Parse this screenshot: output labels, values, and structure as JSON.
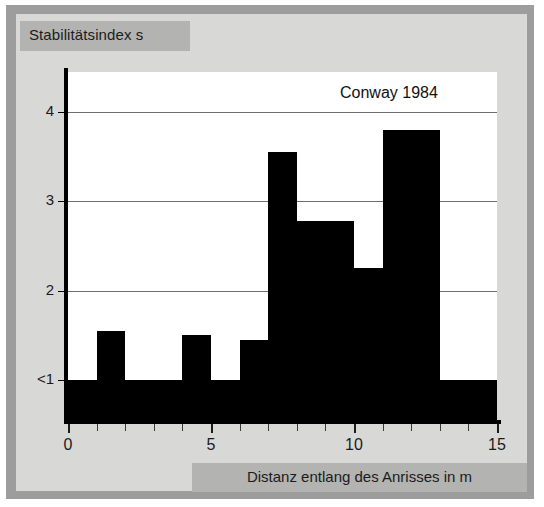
{
  "figure": {
    "annotation": "Conway 1984",
    "y_axis_caption": "Stabilitätsindex s",
    "x_axis_caption": "Distanz entlang des Anrisses in m"
  },
  "colors": {
    "bar": "#000000",
    "panel_background": "#ffffff",
    "plate_background": "#d8d8d6",
    "caption_band": "#b3b3b1",
    "scan_border": "#9d9d9d",
    "gridline": "#6e6e6e",
    "axis": "#000000",
    "text": "#1b1b1b"
  },
  "chart_data": {
    "type": "bar",
    "title": "",
    "subtitle": "",
    "annotations": [
      "Conway 1984"
    ],
    "xlabel": "Distanz entlang des Anrisses in m",
    "ylabel": "Stabilitätsindex s",
    "xlim": [
      0,
      15
    ],
    "ylim": [
      0.55,
      4.45
    ],
    "xticks": [
      0,
      5,
      10,
      15
    ],
    "xtick_labels": [
      "0",
      "5",
      "10",
      "15"
    ],
    "xminor_ticks": [
      1,
      2,
      3,
      4,
      6,
      7,
      8,
      9,
      11,
      12,
      13,
      14
    ],
    "yticks": [
      1,
      2,
      3,
      4
    ],
    "ytick_labels": [
      "<1",
      "2",
      "3",
      "4"
    ],
    "grid": "horizontal",
    "legend": "none",
    "baseline": 1,
    "baseline_note": "bars at the axis minimum represent s < 1",
    "bin_edges": [
      0,
      1,
      2,
      3,
      4,
      5,
      6,
      7,
      8,
      9,
      10,
      11,
      13,
      15
    ],
    "bins": [
      {
        "x0": 0,
        "x1": 1,
        "value": 1.0,
        "label": "<1"
      },
      {
        "x0": 1,
        "x1": 2,
        "value": 1.55,
        "label": "1.55"
      },
      {
        "x0": 2,
        "x1": 3,
        "value": 1.0,
        "label": "<1"
      },
      {
        "x0": 3,
        "x1": 4,
        "value": 1.0,
        "label": "<1"
      },
      {
        "x0": 4,
        "x1": 5,
        "value": 1.5,
        "label": "1.5"
      },
      {
        "x0": 5,
        "x1": 6,
        "value": 1.0,
        "label": "<1"
      },
      {
        "x0": 6,
        "x1": 7,
        "value": 1.45,
        "label": "1.45"
      },
      {
        "x0": 7,
        "x1": 8,
        "value": 3.55,
        "label": "3.55"
      },
      {
        "x0": 8,
        "x1": 9,
        "value": 2.78,
        "label": "2.78"
      },
      {
        "x0": 9,
        "x1": 10,
        "value": 2.78,
        "label": "2.78"
      },
      {
        "x0": 10,
        "x1": 11,
        "value": 2.25,
        "label": "2.25"
      },
      {
        "x0": 11,
        "x1": 13,
        "value": 3.8,
        "label": "3.8"
      },
      {
        "x0": 13,
        "x1": 15,
        "value": 1.0,
        "label": "<1"
      }
    ],
    "categories": [
      "0-1",
      "1-2",
      "2-3",
      "3-4",
      "4-5",
      "5-6",
      "6-7",
      "7-8",
      "8-9",
      "9-10",
      "10-11",
      "11-13",
      "13-15"
    ],
    "values": [
      1.0,
      1.55,
      1.0,
      1.0,
      1.5,
      1.0,
      1.45,
      3.55,
      2.78,
      2.78,
      2.25,
      3.8,
      1.0
    ]
  }
}
